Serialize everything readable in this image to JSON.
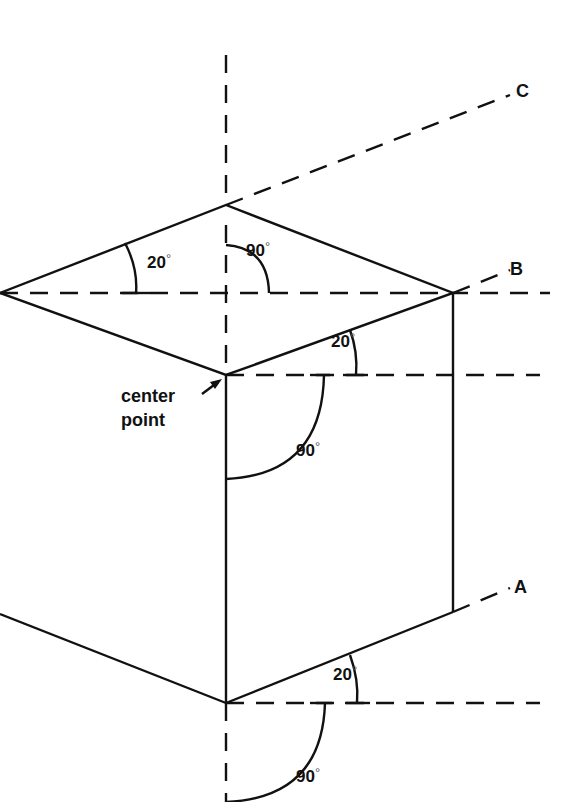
{
  "diagram": {
    "axis_labels": {
      "a": "A",
      "b": "B",
      "c": "C"
    },
    "center_label": {
      "line1": "center",
      "line2": "point"
    },
    "angles": {
      "top_left": "20",
      "top_right": "90",
      "mid_right": "20",
      "mid_center": "90",
      "bottom_right": "20",
      "bottom_center": "90"
    },
    "degree_symbol": "°",
    "colors": {
      "line": "#111111",
      "background": "#ffffff"
    }
  }
}
